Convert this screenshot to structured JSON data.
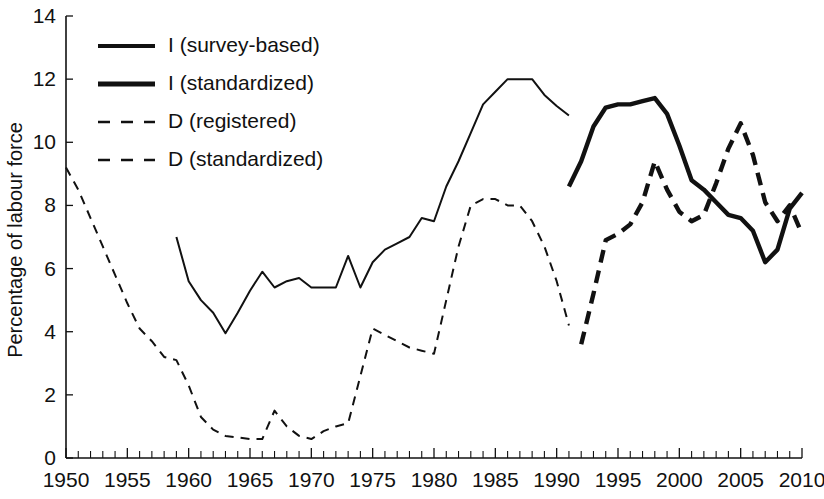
{
  "chart_data": {
    "type": "line",
    "title": "",
    "xlabel": "",
    "ylabel": "Percentage of labour force",
    "xlim": [
      1950,
      2010
    ],
    "ylim": [
      0,
      14
    ],
    "ytick_step": 2,
    "xtick_step": 5,
    "xtick_minor_step": 1,
    "grid": false,
    "legend_position": "top-left",
    "yticks": [
      "0",
      "2",
      "4",
      "6",
      "8",
      "10",
      "12",
      "14"
    ],
    "xticks": [
      "1950",
      "1955",
      "1960",
      "1965",
      "1970",
      "1975",
      "1980",
      "1985",
      "1990",
      "1995",
      "2000",
      "2005",
      "2010"
    ],
    "series": [
      {
        "name": "I (survey-based)",
        "style": "solid",
        "width": 2.0,
        "color": "#111111",
        "x": [
          1959,
          1960,
          1961,
          1962,
          1963,
          1964,
          1965,
          1966,
          1967,
          1968,
          1969,
          1970,
          1971,
          1972,
          1973,
          1974,
          1975,
          1976,
          1977,
          1978,
          1979,
          1980,
          1981,
          1982,
          1983,
          1984,
          1985,
          1986,
          1987,
          1988,
          1989,
          1990,
          1991
        ],
        "values": [
          7.0,
          5.6,
          5.0,
          4.6,
          3.95,
          4.6,
          5.3,
          5.9,
          5.4,
          5.6,
          5.7,
          5.4,
          5.4,
          5.4,
          6.4,
          5.4,
          6.2,
          6.6,
          6.8,
          7.0,
          7.6,
          7.5,
          8.6,
          9.4,
          10.3,
          11.2,
          11.6,
          12.0,
          12.0,
          12.0,
          11.5,
          11.15,
          10.85
        ]
      },
      {
        "name": "I (standardized)",
        "style": "solid",
        "width": 4.4,
        "color": "#111111",
        "x": [
          1991,
          1992,
          1993,
          1994,
          1995,
          1996,
          1997,
          1998,
          1999,
          2000,
          2001,
          2002,
          2003,
          2004,
          2005,
          2006,
          2007,
          2008,
          2009,
          2010
        ],
        "values": [
          8.6,
          9.4,
          10.5,
          11.1,
          11.2,
          11.2,
          11.3,
          11.4,
          10.9,
          9.9,
          8.8,
          8.5,
          8.1,
          7.7,
          7.6,
          7.2,
          6.2,
          6.6,
          7.9,
          8.4
        ]
      },
      {
        "name": "D (registered)",
        "style": "dashed",
        "width": 2.0,
        "color": "#111111",
        "x": [
          1950,
          1951,
          1952,
          1953,
          1954,
          1955,
          1956,
          1957,
          1958,
          1959,
          1960,
          1961,
          1962,
          1963,
          1964,
          1965,
          1966,
          1967,
          1968,
          1969,
          1970,
          1971,
          1972,
          1973,
          1974,
          1975,
          1976,
          1977,
          1978,
          1979,
          1980,
          1981,
          1982,
          1983,
          1984,
          1985,
          1986,
          1987,
          1988,
          1989,
          1990,
          1991
        ],
        "values": [
          9.2,
          8.5,
          7.6,
          6.7,
          5.8,
          4.9,
          4.1,
          3.7,
          3.2,
          3.1,
          2.3,
          1.3,
          0.9,
          0.7,
          0.65,
          0.6,
          0.6,
          1.5,
          1.0,
          0.7,
          0.6,
          0.85,
          1.0,
          1.1,
          2.6,
          4.1,
          3.9,
          3.7,
          3.5,
          3.4,
          3.3,
          5.0,
          6.7,
          8.0,
          8.2,
          8.2,
          8.0,
          8.0,
          7.5,
          6.7,
          5.6,
          4.2
        ]
      },
      {
        "name": "D (standardized)",
        "style": "dashed",
        "width": 4.4,
        "color": "#111111",
        "x": [
          1992,
          1993,
          1994,
          1995,
          1996,
          1997,
          1998,
          1999,
          2000,
          2001,
          2002,
          2003,
          2004,
          2005,
          2006,
          2007,
          2008,
          2009,
          2010
        ],
        "values": [
          3.6,
          5.2,
          6.9,
          7.1,
          7.4,
          8.1,
          9.4,
          8.5,
          7.8,
          7.5,
          7.7,
          8.7,
          9.8,
          10.6,
          9.6,
          8.1,
          7.5,
          8.0,
          7.1
        ]
      }
    ]
  },
  "legend": {
    "items": [
      {
        "label": "I (survey-based)",
        "style": "solid",
        "width": 4.0
      },
      {
        "label": "I (standardized)",
        "style": "solid",
        "width": 5.0
      },
      {
        "label": "D (registered)",
        "style": "dashed",
        "width": 2.6
      },
      {
        "label": "D (standardized)",
        "style": "dashed",
        "width": 2.6
      }
    ]
  }
}
